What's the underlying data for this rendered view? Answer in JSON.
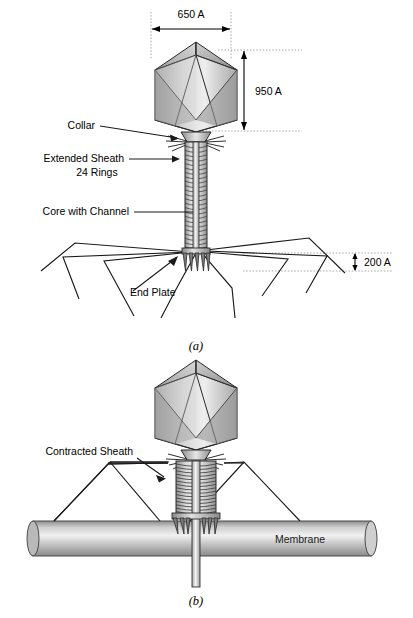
{
  "figure": {
    "panels": [
      {
        "caption": "(a)",
        "name": "extended-state",
        "labels": [
          {
            "id": "collar",
            "text": "Collar"
          },
          {
            "id": "extended-sheath",
            "text": "Extended Sheath"
          },
          {
            "id": "extended-sheath-rings",
            "text": "24 Rings"
          },
          {
            "id": "core-with-channel",
            "text": "Core with Channel"
          },
          {
            "id": "end-plate",
            "text": "End Plate"
          }
        ],
        "dimensions": [
          {
            "id": "head-width",
            "text": "650 A",
            "orientation": "horizontal"
          },
          {
            "id": "head-height",
            "text": "950 A",
            "orientation": "vertical"
          },
          {
            "id": "base-plate-height",
            "text": "200 A",
            "orientation": "vertical"
          }
        ]
      },
      {
        "caption": "(b)",
        "name": "contracted-state",
        "labels": [
          {
            "id": "contracted-sheath",
            "text": "Contracted Sheath"
          },
          {
            "id": "membrane",
            "text": "Membrane"
          }
        ],
        "dimensions": []
      }
    ]
  },
  "colors": {
    "ink": "#000000",
    "capsid_light": "#e8e8e8",
    "capsid_mid": "#bdbdbd",
    "capsid_dark": "#8a8a8a",
    "capsid_darkest": "#6f6f6f",
    "sheath_light": "#e2e2e2",
    "sheath_dark": "#9a9a9a",
    "membrane_light": "#efefef",
    "membrane_dark": "#8d8d8d",
    "guide": "#9a9a9a"
  }
}
